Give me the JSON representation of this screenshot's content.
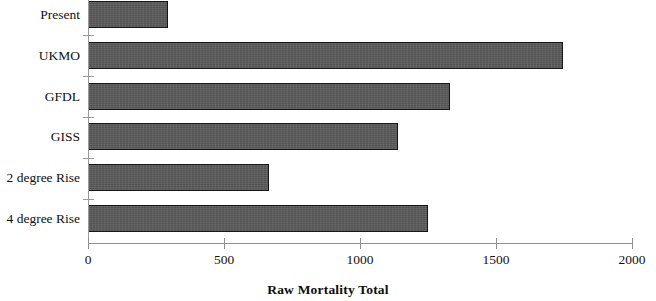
{
  "chart_data": {
    "type": "bar",
    "orientation": "horizontal",
    "title": "",
    "xlabel": "Raw Mortality Total",
    "ylabel": "",
    "categories": [
      "Present",
      "UKMO",
      "GFDL",
      "GISS",
      "2 degree Rise",
      "4 degree Rise"
    ],
    "values": [
      295,
      1745,
      1330,
      1140,
      665,
      1250
    ],
    "xlim": [
      0,
      2000
    ],
    "xticks": [
      0,
      500,
      1000,
      1500,
      2000
    ],
    "xtick_labels": [
      "0",
      "500",
      "1000",
      "1500",
      "2000"
    ],
    "grid": false,
    "legend": null,
    "series": [
      {
        "name": "Raw Mortality Total",
        "values": [
          295,
          1745,
          1330,
          1140,
          665,
          1250
        ],
        "color": "#5b5b5b",
        "edge_color": "#161616"
      }
    ]
  },
  "axis": {
    "x_title": "Raw Mortality Total",
    "tick_labels": [
      "0",
      "500",
      "1000",
      "1500",
      "2000"
    ],
    "line_color": "#8d8d8d"
  },
  "bars": [
    {
      "label": "Present",
      "value": 295
    },
    {
      "label": "UKMO",
      "value": 1745
    },
    {
      "label": "GFDL",
      "value": 1330
    },
    {
      "label": "GISS",
      "value": 1140
    },
    {
      "label": "2 degree Rise",
      "value": 665
    },
    {
      "label": "4 degree Rise",
      "value": 1250
    }
  ]
}
